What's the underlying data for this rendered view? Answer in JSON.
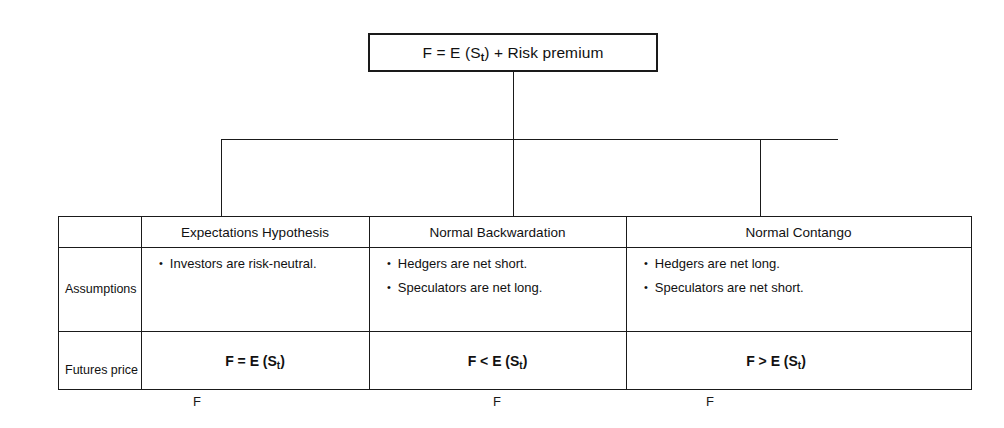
{
  "diagram": {
    "title_box": {
      "prefix": "F = E (S",
      "sub": "t",
      "suffix": ") + Risk premium",
      "full_text": "F = E (St) + Risk premium"
    },
    "table": {
      "row_labels": [
        "",
        "Assumptions",
        "Futures price"
      ],
      "columns": [
        {
          "header": "Expectations Hypothesis",
          "assumptions": [
            "Investors are risk-neutral."
          ],
          "futures_price": {
            "prefix": "F = E (S",
            "sub": "t",
            "suffix": ")",
            "full_text": "F = E (St)"
          },
          "below_mark": "F"
        },
        {
          "header": "Normal Backwardation",
          "assumptions": [
            "Hedgers are net short.",
            "Speculators are net long."
          ],
          "futures_price": {
            "prefix": "F < E (S",
            "sub": "t",
            "suffix": ")",
            "full_text": "F < E (St)"
          },
          "below_mark": "F"
        },
        {
          "header": "Normal Contango",
          "assumptions": [
            "Hedgers are net long.",
            "Speculators are net short."
          ],
          "futures_price": {
            "prefix": "F > E (S",
            "sub": "t",
            "suffix": ")",
            "full_text": "F > E (St)"
          },
          "below_mark": "F"
        }
      ]
    },
    "bullet_glyph": "•",
    "colors": {
      "line": "#1a1a1a",
      "text": "#111111",
      "background": "#ffffff"
    }
  }
}
